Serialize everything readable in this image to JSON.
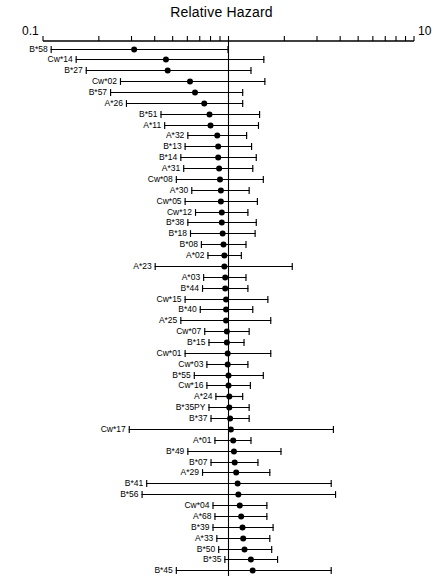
{
  "chart_data": {
    "type": "scatter",
    "subtype": "forest-plot",
    "title": "Relative Hazard",
    "xlabel": "",
    "ylabel": "",
    "xscale": "log",
    "xlim": [
      0.1,
      10
    ],
    "axis_tick_labels": [
      "0.1",
      "10"
    ],
    "reference_line": 1.0,
    "grid": false,
    "legend": null,
    "point_label": "hazard ratio",
    "interval_label": "confidence interval",
    "categories": [
      "B*58",
      "Cw*14",
      "B*27",
      "Cw*02",
      "B*57",
      "A*26",
      "B*51",
      "A*11",
      "A*32",
      "B*13",
      "B*14",
      "A*31",
      "Cw*08",
      "A*30",
      "Cw*05",
      "Cw*12",
      "B*38",
      "B*18",
      "B*08",
      "A*02",
      "A*23",
      "A*03",
      "B*44",
      "Cw*15",
      "B*40",
      "A*25",
      "Cw*07",
      "B*15",
      "Cw*01",
      "Cw*03",
      "B*55",
      "Cw*16",
      "A*24",
      "B*35PY",
      "B*37",
      "Cw*17",
      "A*01",
      "B*49",
      "B*07",
      "A*29",
      "B*41",
      "B*56",
      "Cw*04",
      "A*68",
      "B*39",
      "A*33",
      "B*50",
      "B*35",
      "B*45",
      "B*53",
      "B*35Px",
      "A*74",
      "A*66"
    ],
    "values": [
      0.31,
      0.46,
      0.47,
      0.62,
      0.66,
      0.74,
      0.79,
      0.8,
      0.87,
      0.88,
      0.88,
      0.89,
      0.9,
      0.91,
      0.91,
      0.92,
      0.92,
      0.93,
      0.94,
      0.95,
      0.95,
      0.96,
      0.96,
      0.97,
      0.97,
      0.97,
      0.98,
      0.98,
      0.99,
      0.99,
      1.0,
      1.0,
      1.01,
      1.01,
      1.02,
      1.03,
      1.06,
      1.07,
      1.08,
      1.1,
      1.12,
      1.13,
      1.15,
      1.17,
      1.19,
      1.2,
      1.22,
      1.32,
      1.35,
      1.42,
      1.44,
      1.46,
      1.72
    ],
    "ci_low": [
      0.11,
      0.15,
      0.17,
      0.26,
      0.23,
      0.28,
      0.43,
      0.45,
      0.6,
      0.58,
      0.55,
      0.57,
      0.52,
      0.63,
      0.58,
      0.66,
      0.6,
      0.62,
      0.71,
      0.77,
      0.4,
      0.73,
      0.72,
      0.58,
      0.7,
      0.55,
      0.74,
      0.78,
      0.58,
      0.76,
      0.65,
      0.76,
      0.85,
      0.78,
      0.8,
      0.29,
      0.84,
      0.6,
      0.8,
      0.72,
      0.36,
      0.34,
      0.82,
      0.84,
      0.82,
      0.86,
      0.88,
      0.95,
      0.52,
      0.62,
      0.88,
      0.26,
      0.24
    ],
    "ci_high": [
      1.0,
      1.56,
      1.33,
      1.58,
      1.2,
      1.2,
      1.48,
      1.46,
      1.26,
      1.34,
      1.42,
      1.36,
      1.55,
      1.3,
      1.44,
      1.28,
      1.42,
      1.4,
      1.25,
      1.18,
      2.22,
      1.25,
      1.28,
      1.64,
      1.36,
      1.7,
      1.3,
      1.22,
      1.7,
      1.28,
      1.55,
      1.32,
      1.2,
      1.3,
      1.3,
      3.7,
      1.33,
      1.93,
      1.45,
      1.68,
      3.6,
      3.8,
      1.62,
      1.62,
      1.75,
      1.68,
      1.72,
      1.85,
      3.6,
      3.3,
      2.4,
      6.1,
      4.3
    ]
  },
  "axis": {
    "low_label": "0.1",
    "high_label": "10"
  },
  "title": "Relative Hazard"
}
